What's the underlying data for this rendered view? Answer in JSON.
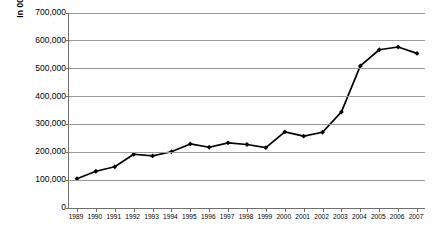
{
  "chart_data": {
    "type": "line",
    "title": "",
    "xlabel": "",
    "ylabel": "In 000 Kilograms",
    "categories": [
      "1989",
      "1990",
      "1991",
      "1992",
      "1993",
      "1994",
      "1995",
      "1996",
      "1997",
      "1998",
      "1999",
      "2000",
      "2001",
      "2002",
      "2003",
      "2004",
      "2005",
      "2006",
      "2007"
    ],
    "values": [
      105000,
      132000,
      148000,
      193000,
      187000,
      202000,
      230000,
      218000,
      234000,
      228000,
      217000,
      273000,
      258000,
      272000,
      345000,
      510000,
      568000,
      578000,
      555000
    ],
    "series": [
      {
        "name": "",
        "values": [
          105000,
          132000,
          148000,
          193000,
          187000,
          202000,
          230000,
          218000,
          234000,
          228000,
          217000,
          273000,
          258000,
          272000,
          345000,
          510000,
          568000,
          578000,
          555000
        ]
      }
    ],
    "ylim": [
      0,
      700000
    ],
    "yticks": [
      0,
      100000,
      200000,
      300000,
      400000,
      500000,
      600000,
      700000
    ],
    "ytick_labels": [
      "0",
      "100,000",
      "200,000",
      "300,000",
      "400,000",
      "500,000",
      "600,000",
      "700,000"
    ],
    "grid": true,
    "grid_axis": "y",
    "legend": false,
    "legend_position": "none",
    "marker": "diamond",
    "line_color": "#000000",
    "marker_color": "#000000",
    "grid_color": "#9a9a9a",
    "axis_color": "#6e6e6e",
    "background_color": "#ffffff"
  }
}
